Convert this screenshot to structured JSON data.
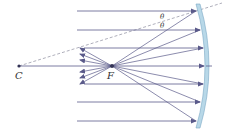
{
  "diagram": {
    "type": "concave-mirror-ray-diagram",
    "labels": {
      "center": "C",
      "focus": "F",
      "angle_top": "θ",
      "angle_bottom": "θ"
    },
    "colors": {
      "ray": "#5a5a8a",
      "mirror_fill": "#b8d8e8",
      "mirror_edge": "#7aa8c4",
      "dashed": "#9a9aaa",
      "point": "#333355"
    },
    "points": {
      "C": [
        19,
        66
      ],
      "F": [
        112,
        66
      ]
    },
    "incident_ray_heights": [
      11,
      30,
      48,
      66,
      84,
      102,
      121
    ],
    "ray_start_x": 77,
    "mirror": {
      "top": [
        196,
        5
      ],
      "vertex": [
        205,
        66
      ],
      "bottom": [
        196,
        127
      ]
    }
  }
}
